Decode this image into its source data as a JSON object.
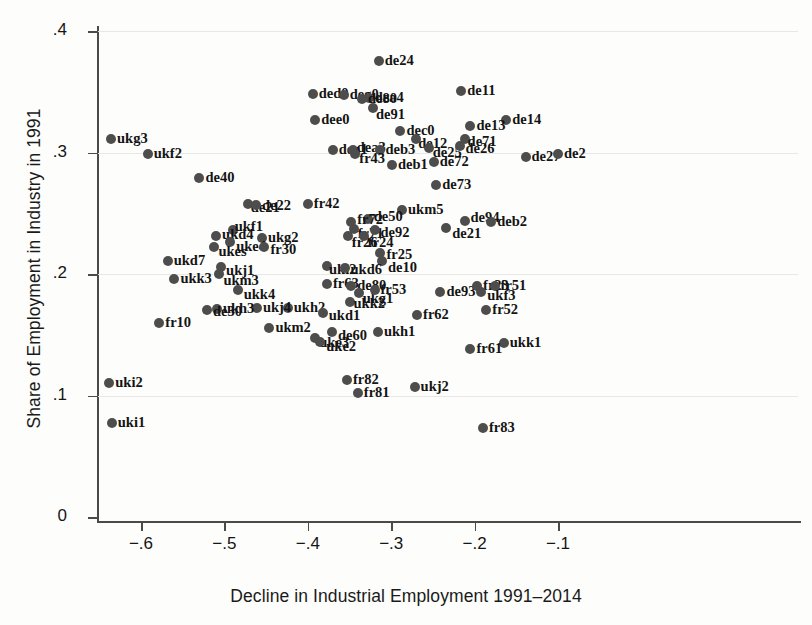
{
  "chart_data": {
    "type": "scatter",
    "title": "",
    "xlabel": "Decline in Industrial Employment 1991–2014",
    "ylabel": "Share of Employment in Industry in 1991",
    "xlim": [
      -0.655,
      0.0
    ],
    "ylim": [
      0.0,
      0.42
    ],
    "xticks": [
      -0.6,
      -0.5,
      -0.4,
      -0.3,
      -0.2,
      -0.1
    ],
    "xticklabels": [
      "−.6",
      "−.5",
      "−.4",
      "−.3",
      "−.2",
      "−.1"
    ],
    "yticks": [
      0,
      0.1,
      0.2,
      0.3,
      0.4
    ],
    "yticklabels": [
      "0",
      ".1",
      ".2",
      ".3",
      ".4"
    ],
    "grid": "faint-horizontal",
    "legend": "none",
    "marker_color": "#4d4d4d",
    "points": [
      {
        "label": "de24",
        "x": -0.315,
        "y": 0.375
      },
      {
        "label": "ded0",
        "x": -0.394,
        "y": 0.348
      },
      {
        "label": "deg0",
        "x": -0.357,
        "y": 0.347
      },
      {
        "label": "dea4",
        "x": -0.327,
        "y": 0.345
      },
      {
        "label": "de80",
        "x": -0.335,
        "y": 0.344
      },
      {
        "label": "de11",
        "x": -0.216,
        "y": 0.351
      },
      {
        "label": "de91",
        "x": -0.322,
        "y": 0.337
      },
      {
        "label": "dee0",
        "x": -0.391,
        "y": 0.327
      },
      {
        "label": "de14",
        "x": -0.162,
        "y": 0.327
      },
      {
        "label": "de13",
        "x": -0.205,
        "y": 0.322
      },
      {
        "label": "dec0",
        "x": -0.289,
        "y": 0.318
      },
      {
        "label": "de12",
        "x": -0.27,
        "y": 0.311
      },
      {
        "label": "de71",
        "x": -0.212,
        "y": 0.311
      },
      {
        "label": "ukg3",
        "x": -0.636,
        "y": 0.311
      },
      {
        "label": "de25",
        "x": -0.255,
        "y": 0.304
      },
      {
        "label": "de26",
        "x": -0.217,
        "y": 0.305
      },
      {
        "label": "dea1",
        "x": -0.37,
        "y": 0.302
      },
      {
        "label": "dea3",
        "x": -0.346,
        "y": 0.302
      },
      {
        "label": "deb3",
        "x": -0.314,
        "y": 0.302
      },
      {
        "label": "fr43",
        "x": -0.343,
        "y": 0.299
      },
      {
        "label": "ukf2",
        "x": -0.592,
        "y": 0.299
      },
      {
        "label": "de27",
        "x": -0.139,
        "y": 0.296
      },
      {
        "label": "de2",
        "x": -0.1,
        "y": 0.299
      },
      {
        "label": "de72",
        "x": -0.249,
        "y": 0.292
      },
      {
        "label": "deb1",
        "x": -0.299,
        "y": 0.29
      },
      {
        "label": "de40",
        "x": -0.53,
        "y": 0.279
      },
      {
        "label": "de73",
        "x": -0.246,
        "y": 0.273
      },
      {
        "label": "de21",
        "x": -0.472,
        "y": 0.258
      },
      {
        "label": "de22",
        "x": -0.462,
        "y": 0.257
      },
      {
        "label": "fr42",
        "x": -0.4,
        "y": 0.258
      },
      {
        "label": "ukm5",
        "x": -0.287,
        "y": 0.253
      },
      {
        "label": "de94",
        "x": -0.211,
        "y": 0.244
      },
      {
        "label": "de50",
        "x": -0.328,
        "y": 0.245
      },
      {
        "label": "fr72",
        "x": -0.348,
        "y": 0.243
      },
      {
        "label": "deb2",
        "x": -0.18,
        "y": 0.243
      },
      {
        "label": "de21b",
        "x": -0.234,
        "y": 0.238
      },
      {
        "label": "ukf1",
        "x": -0.49,
        "y": 0.236
      },
      {
        "label": "fr71",
        "x": -0.345,
        "y": 0.237
      },
      {
        "label": "de92",
        "x": -0.32,
        "y": 0.236
      },
      {
        "label": "fr26",
        "x": -0.352,
        "y": 0.231
      },
      {
        "label": "fr24",
        "x": -0.333,
        "y": 0.231
      },
      {
        "label": "ukd4",
        "x": -0.51,
        "y": 0.231
      },
      {
        "label": "ukg2",
        "x": -0.455,
        "y": 0.23
      },
      {
        "label": "uke4",
        "x": -0.493,
        "y": 0.226
      },
      {
        "label": "ukes",
        "x": -0.512,
        "y": 0.222
      },
      {
        "label": "fr30",
        "x": -0.452,
        "y": 0.222
      },
      {
        "label": "fr25",
        "x": -0.313,
        "y": 0.217
      },
      {
        "label": "ukd7",
        "x": -0.568,
        "y": 0.211
      },
      {
        "label": "de10",
        "x": -0.311,
        "y": 0.211
      },
      {
        "label": "ukj1",
        "x": -0.504,
        "y": 0.206
      },
      {
        "label": "uki2b",
        "x": -0.377,
        "y": 0.207
      },
      {
        "label": "ukd6",
        "x": -0.356,
        "y": 0.205
      },
      {
        "label": "ukm3",
        "x": -0.506,
        "y": 0.2
      },
      {
        "label": "ukk3",
        "x": -0.56,
        "y": 0.196
      },
      {
        "label": "fr63",
        "x": -0.377,
        "y": 0.192
      },
      {
        "label": "de80b",
        "x": -0.348,
        "y": 0.19
      },
      {
        "label": "ukk4",
        "x": -0.484,
        "y": 0.187
      },
      {
        "label": "ukg1",
        "x": -0.339,
        "y": 0.184
      },
      {
        "label": "fr53",
        "x": -0.32,
        "y": 0.187
      },
      {
        "label": "de93",
        "x": -0.241,
        "y": 0.185
      },
      {
        "label": "fr23",
        "x": -0.197,
        "y": 0.19
      },
      {
        "label": "fr51",
        "x": -0.176,
        "y": 0.19
      },
      {
        "label": "ukf3",
        "x": -0.192,
        "y": 0.185
      },
      {
        "label": "ukk2",
        "x": -0.35,
        "y": 0.177
      },
      {
        "label": "ukh2",
        "x": -0.424,
        "y": 0.172
      },
      {
        "label": "ukj4",
        "x": -0.461,
        "y": 0.172
      },
      {
        "label": "ukh3",
        "x": -0.509,
        "y": 0.171
      },
      {
        "label": "de30",
        "x": -0.521,
        "y": 0.17
      },
      {
        "label": "ukd1",
        "x": -0.382,
        "y": 0.168
      },
      {
        "label": "fr52",
        "x": -0.186,
        "y": 0.17
      },
      {
        "label": "fr62",
        "x": -0.269,
        "y": 0.166
      },
      {
        "label": "fr10",
        "x": -0.578,
        "y": 0.16
      },
      {
        "label": "ukm2",
        "x": -0.446,
        "y": 0.156
      },
      {
        "label": "de60",
        "x": -0.371,
        "y": 0.152
      },
      {
        "label": "uke3",
        "x": -0.391,
        "y": 0.147
      },
      {
        "label": "ukh1",
        "x": -0.316,
        "y": 0.152
      },
      {
        "label": "uke2",
        "x": -0.385,
        "y": 0.144
      },
      {
        "label": "ukk1",
        "x": -0.165,
        "y": 0.143
      },
      {
        "label": "fr61",
        "x": -0.205,
        "y": 0.138
      },
      {
        "label": "uki2",
        "x": -0.638,
        "y": 0.11
      },
      {
        "label": "fr82",
        "x": -0.353,
        "y": 0.113
      },
      {
        "label": "ukj2",
        "x": -0.272,
        "y": 0.107
      },
      {
        "label": "fr81",
        "x": -0.34,
        "y": 0.102
      },
      {
        "label": "uki1",
        "x": -0.635,
        "y": 0.077
      },
      {
        "label": "fr83",
        "x": -0.19,
        "y": 0.073
      }
    ],
    "label_offsets": {
      "de24": [
        6,
        -9
      ],
      "ded0": [
        6,
        -9
      ],
      "deg0": [
        6,
        -9
      ],
      "dea4": [
        6,
        -9
      ],
      "de80": [
        6,
        -9
      ],
      "de11": [
        6,
        -9
      ],
      "de91": [
        3,
        -2
      ],
      "dee0": [
        6,
        -9
      ],
      "de14": [
        6,
        -9
      ],
      "de13": [
        6,
        -9
      ],
      "dec0": [
        6,
        -9
      ],
      "de12": [
        2,
        -4
      ],
      "de71": [
        3,
        -6
      ],
      "ukg3": [
        6,
        -9
      ],
      "de25": [
        4,
        -4
      ],
      "de26": [
        5,
        -6
      ],
      "dea1": [
        6,
        -9
      ],
      "dea3": [
        4,
        -11
      ],
      "deb3": [
        6,
        -9
      ],
      "fr43": [
        4,
        -4
      ],
      "ukf2": [
        6,
        -9
      ],
      "de27": [
        6,
        -9
      ],
      "de2": [
        6,
        -9
      ],
      "de72": [
        6,
        -9
      ],
      "deb1": [
        6,
        -9
      ],
      "de40": [
        6,
        -9
      ],
      "de73": [
        6,
        -9
      ],
      "de21": [
        3,
        -5
      ],
      "de22": [
        6,
        -8
      ],
      "fr42": [
        6,
        -9
      ],
      "ukm5": [
        6,
        -9
      ],
      "de94": [
        5,
        -12
      ],
      "de50": [
        6,
        -11
      ],
      "fr72": [
        6,
        -11
      ],
      "deb2": [
        6,
        -9
      ],
      "de21b": [
        6,
        -3
      ],
      "ukf1": [
        2,
        -12
      ],
      "fr71": [
        4,
        -4
      ],
      "de92": [
        6,
        -6
      ],
      "fr26": [
        4,
        -2
      ],
      "fr24": [
        4,
        -2
      ],
      "ukd4": [
        6,
        -10
      ],
      "ukg2": [
        6,
        -9
      ],
      "uke4": [
        6,
        -4
      ],
      "ukes": [
        4,
        -4
      ],
      "fr30": [
        6,
        -6
      ],
      "fr25": [
        6,
        -7
      ],
      "ukd7": [
        6,
        -9
      ],
      "de10": [
        6,
        -2
      ],
      "ukj1": [
        5,
        -5
      ],
      "uki2b": [
        2,
        -5
      ],
      "ukd6": [
        6,
        -7
      ],
      "ukm3": [
        4,
        -2
      ],
      "ukk3": [
        6,
        -9
      ],
      "fr63": [
        6,
        -9
      ],
      "de80b": [
        6,
        -9
      ],
      "ukk4": [
        6,
        -4
      ],
      "ukg1": [
        4,
        -3
      ],
      "fr53": [
        6,
        -9
      ],
      "de93": [
        6,
        -9
      ],
      "fr23": [
        6,
        -9
      ],
      "fr51": [
        6,
        -9
      ],
      "ukf3": [
        6,
        -5
      ],
      "ukk2": [
        4,
        -7
      ],
      "ukh2": [
        6,
        -9
      ],
      "ukj4": [
        6,
        -9
      ],
      "ukh3": [
        6,
        -9
      ],
      "de30": [
        6,
        -7
      ],
      "ukd1": [
        6,
        -6
      ],
      "fr52": [
        6,
        -9
      ],
      "fr62": [
        6,
        -9
      ],
      "fr10": [
        6,
        -9
      ],
      "ukm2": [
        6,
        -9
      ],
      "de60": [
        6,
        -5
      ],
      "uke3": [
        4,
        -4
      ],
      "ukh1": [
        6,
        -9
      ],
      "uke2": [
        6,
        -4
      ],
      "ukk1": [
        6,
        -9
      ],
      "fr61": [
        6,
        -9
      ],
      "uki2": [
        6,
        -9
      ],
      "fr82": [
        6,
        -9
      ],
      "ukj2": [
        6,
        -9
      ],
      "fr81": [
        6,
        -9
      ],
      "uki1": [
        6,
        -9
      ],
      "fr83": [
        6,
        -9
      ]
    },
    "display_labels": {
      "de21b": "de21",
      "uki2b": "uki2",
      "de80b": "de80"
    }
  },
  "axes": {
    "x_title": "Decline in Industrial Employment 1991–2014",
    "y_title": "Share of Employment in Industry in 1991"
  }
}
